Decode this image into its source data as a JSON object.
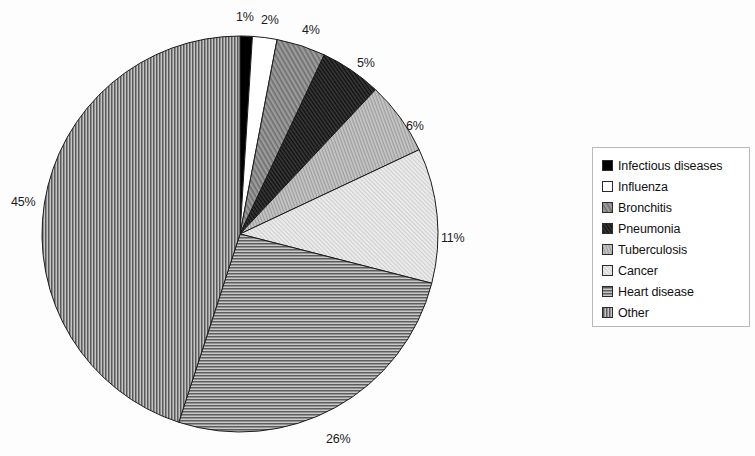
{
  "chart_data": {
    "type": "pie",
    "title": "",
    "subtitle": "",
    "xlabel": "",
    "ylabel": "",
    "legend_position": "right",
    "grid": false,
    "start_angle_deg": 0,
    "direction": "clockwise",
    "categories": [
      "Infectious diseases",
      "Influenza",
      "Bronchitis",
      "Pneumonia",
      "Tuberculosis",
      "Cancer",
      "Heart disease",
      "Other"
    ],
    "values": [
      1,
      2,
      4,
      5,
      6,
      11,
      26,
      45
    ],
    "value_unit": "%",
    "data_labels": [
      "1%",
      "2%",
      "4%",
      "5%",
      "6%",
      "11%",
      "26%",
      "45%"
    ],
    "slice_fills": [
      "solid-black",
      "solid-white",
      "medium-gray",
      "dark-gray-diagonal",
      "light-gray-diagonal",
      "very-light-gray-diagonal",
      "horizontal-lines",
      "vertical-lines"
    ],
    "slice_colors": [
      "#000000",
      "#ffffff",
      "#8a8a8a",
      "#2e2e2e",
      "#b4b4b4",
      "#dedede",
      "#9a9a9a",
      "#8f8f8f"
    ]
  },
  "labels": [
    {
      "text": "1%",
      "x": 236,
      "y": 10
    },
    {
      "text": "2%",
      "x": 261,
      "y": 13
    },
    {
      "text": "4%",
      "x": 302,
      "y": 23
    },
    {
      "text": "5%",
      "x": 357,
      "y": 56
    },
    {
      "text": "6%",
      "x": 406,
      "y": 119
    },
    {
      "text": "11%",
      "x": 441,
      "y": 231
    },
    {
      "text": "26%",
      "x": 326,
      "y": 432
    },
    {
      "text": "45%",
      "x": 11,
      "y": 195
    }
  ],
  "legend": {
    "items": [
      {
        "label": "Infectious diseases",
        "fill": "solid-black"
      },
      {
        "label": "Influenza",
        "fill": "solid-white"
      },
      {
        "label": "Bronchitis",
        "fill": "medium-gray"
      },
      {
        "label": "Pneumonia",
        "fill": "dark-gray-diagonal"
      },
      {
        "label": "Tuberculosis",
        "fill": "light-gray-diagonal"
      },
      {
        "label": "Cancer",
        "fill": "very-light-gray-diagonal"
      },
      {
        "label": "Heart disease",
        "fill": "horizontal-lines"
      },
      {
        "label": "Other",
        "fill": "vertical-lines"
      }
    ]
  },
  "geometry": {
    "center_x": 240,
    "center_y": 234,
    "radius": 198
  }
}
